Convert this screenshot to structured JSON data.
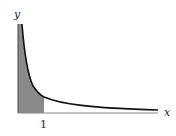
{
  "diagram": {
    "x_axis_label": "x",
    "y_axis_label": "y",
    "tick_label": "1",
    "curve": "improper integral curve (e.g. y = 1/sqrt(x)) approaching y-axis asymptotically",
    "shaded_region": "area under curve from 0 to 1",
    "colors": {
      "shade": "#8a8a8a",
      "curve": "#111111",
      "axis": "#444444"
    }
  }
}
